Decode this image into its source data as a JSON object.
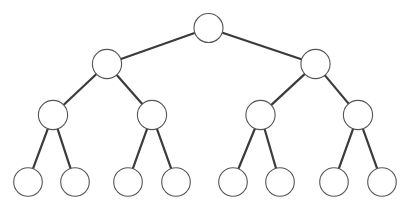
{
  "diagram": {
    "type": "tree",
    "canvas": {
      "width": 406,
      "height": 210,
      "background": "#ffffff"
    },
    "style": {
      "node_fill": "#ffffff",
      "node_stroke": "#555555",
      "node_stroke_width": 1.1,
      "edge_stroke": "#3b3b3b",
      "edge_stroke_width": 2.2,
      "node_radius": 14.5,
      "leaf_radius": 14.3
    },
    "levels": [
      {
        "index": 0,
        "label": "root",
        "y": 28,
        "count": 1
      },
      {
        "index": 1,
        "label": "level-2",
        "y": 64,
        "count": 2
      },
      {
        "index": 2,
        "label": "level-3",
        "y": 115,
        "count": 4
      },
      {
        "index": 3,
        "label": "leaves",
        "y": 182,
        "count": 8
      }
    ],
    "nodes": [
      {
        "id": "n0",
        "label": "",
        "level": 0,
        "cx": 208.5,
        "cy": 28,
        "r": 14.5,
        "role": "root"
      },
      {
        "id": "n1",
        "label": "",
        "level": 1,
        "cx": 107.0,
        "cy": 64,
        "r": 14.6,
        "role": "internal"
      },
      {
        "id": "n2",
        "label": "",
        "level": 1,
        "cx": 315.5,
        "cy": 64,
        "r": 14.6,
        "role": "internal"
      },
      {
        "id": "n3",
        "label": "",
        "level": 2,
        "cx": 53.0,
        "cy": 115,
        "r": 14.6,
        "role": "internal"
      },
      {
        "id": "n4",
        "label": "",
        "level": 2,
        "cx": 152.0,
        "cy": 115,
        "r": 14.6,
        "role": "internal"
      },
      {
        "id": "n5",
        "label": "",
        "level": 2,
        "cx": 260.5,
        "cy": 115,
        "r": 14.6,
        "role": "internal"
      },
      {
        "id": "n6",
        "label": "",
        "level": 2,
        "cx": 358.0,
        "cy": 115,
        "r": 14.6,
        "role": "internal"
      },
      {
        "id": "n7",
        "label": "",
        "level": 3,
        "cx": 28.0,
        "cy": 182,
        "r": 14.3,
        "role": "leaf"
      },
      {
        "id": "n8",
        "label": "",
        "level": 3,
        "cx": 75.0,
        "cy": 182,
        "r": 14.3,
        "role": "leaf"
      },
      {
        "id": "n9",
        "label": "",
        "level": 3,
        "cx": 128.0,
        "cy": 182,
        "r": 14.3,
        "role": "leaf"
      },
      {
        "id": "n10",
        "label": "",
        "level": 3,
        "cx": 176.0,
        "cy": 182,
        "r": 14.3,
        "role": "leaf"
      },
      {
        "id": "n11",
        "label": "",
        "level": 3,
        "cx": 233.0,
        "cy": 182,
        "r": 14.3,
        "role": "leaf"
      },
      {
        "id": "n12",
        "label": "",
        "level": 3,
        "cx": 280.0,
        "cy": 182,
        "r": 14.3,
        "role": "leaf"
      },
      {
        "id": "n13",
        "label": "",
        "level": 3,
        "cx": 334.0,
        "cy": 182,
        "r": 14.3,
        "role": "leaf"
      },
      {
        "id": "n14",
        "label": "",
        "level": 3,
        "cx": 382.0,
        "cy": 182,
        "r": 14.3,
        "role": "leaf"
      }
    ],
    "edges": [
      {
        "from": "n0",
        "to": "n1"
      },
      {
        "from": "n0",
        "to": "n2"
      },
      {
        "from": "n1",
        "to": "n3"
      },
      {
        "from": "n1",
        "to": "n4"
      },
      {
        "from": "n2",
        "to": "n5"
      },
      {
        "from": "n2",
        "to": "n6"
      },
      {
        "from": "n3",
        "to": "n7"
      },
      {
        "from": "n3",
        "to": "n8"
      },
      {
        "from": "n4",
        "to": "n9"
      },
      {
        "from": "n4",
        "to": "n10"
      },
      {
        "from": "n5",
        "to": "n11"
      },
      {
        "from": "n5",
        "to": "n12"
      },
      {
        "from": "n6",
        "to": "n13"
      },
      {
        "from": "n6",
        "to": "n14"
      }
    ]
  }
}
